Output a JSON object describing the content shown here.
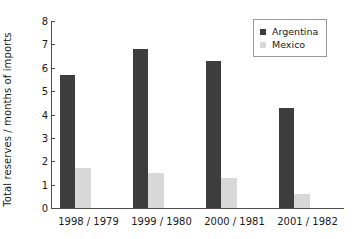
{
  "chart_data": {
    "type": "bar",
    "title": "",
    "xlabel": "",
    "ylabel": "Total reserves / months of imports",
    "categories": [
      "1998 / 1979",
      "1999 / 1980",
      "2000 / 1981",
      "2001 / 1982"
    ],
    "series": [
      {
        "name": "Argentina",
        "color": "#3d3d3d",
        "values": [
          5.7,
          6.8,
          6.3,
          4.3
        ]
      },
      {
        "name": "Mexico",
        "color": "#d8d8d8",
        "values": [
          1.7,
          1.5,
          1.3,
          0.6
        ]
      }
    ],
    "ylim": [
      0,
      8
    ],
    "ytick_labels": [
      "0",
      "1",
      "2",
      "3",
      "4",
      "5",
      "6",
      "7",
      "8"
    ],
    "ytick_values": [
      0,
      1,
      2,
      3,
      4,
      5,
      6,
      7,
      8
    ],
    "grid": false,
    "legend_position": "top-right",
    "legend_entries": [
      "Argentina",
      "Mexico"
    ],
    "axis_color": "#4d4d4d",
    "background": "#ffffff"
  }
}
